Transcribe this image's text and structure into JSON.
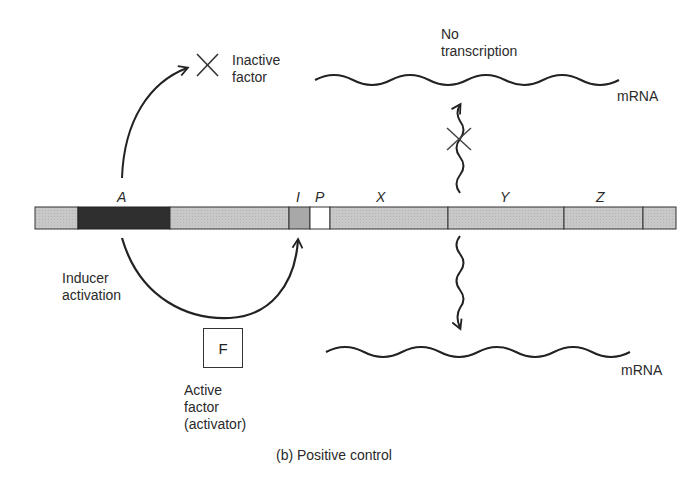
{
  "figure": {
    "caption": "(b) Positive control",
    "colors": {
      "ink": "#2a2a2a",
      "segment_light": "#c6c6c6",
      "segment_dark": "#2f2f2f",
      "segment_mid": "#a8a8a8",
      "segment_promoter": "#ffffff"
    }
  },
  "dna": {
    "genes": [
      {
        "label": "A",
        "role": "regulatory gene"
      },
      {
        "label": "I",
        "role": "initiator / activator site"
      },
      {
        "label": "P",
        "role": "promoter"
      },
      {
        "label": "X",
        "role": "structural gene"
      },
      {
        "label": "Y",
        "role": "structural gene"
      },
      {
        "label": "Z",
        "role": "structural gene"
      }
    ]
  },
  "top_path": {
    "inactive_factor_label_line1": "Inactive",
    "inactive_factor_label_line2": "factor",
    "no_transcription_line1": "No",
    "no_transcription_line2": "transcription",
    "mrna_label": "mRNA",
    "symbol": "×"
  },
  "bottom_path": {
    "inducer_line1": "Inducer",
    "inducer_line2": "activation",
    "factor_letter": "F",
    "active_factor_line1": "Active",
    "active_factor_line2": "factor",
    "active_factor_line3": "(activator)",
    "mrna_label": "mRNA"
  }
}
